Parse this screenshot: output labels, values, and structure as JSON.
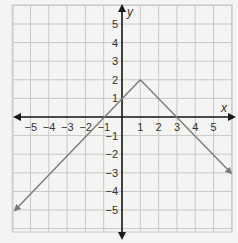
{
  "chart_data": {
    "type": "line",
    "title": "",
    "xlabel": "x",
    "ylabel": "y",
    "xlim": [
      -6,
      6
    ],
    "ylim": [
      -6,
      6
    ],
    "grid": true,
    "x_ticks": [
      -5,
      -4,
      -3,
      -2,
      -1,
      1,
      2,
      3,
      4,
      5
    ],
    "y_ticks": [
      -5,
      -4,
      -3,
      -2,
      -1,
      1,
      2,
      3,
      4,
      5
    ],
    "x_tick_labels": [
      "−5",
      "−4",
      "−3",
      "−2",
      "−1",
      "1",
      "2",
      "3",
      "4",
      "5"
    ],
    "y_tick_labels": [
      "−5",
      "−4",
      "−3",
      "−2",
      "−1",
      "1",
      "2",
      "3",
      "4",
      "5"
    ],
    "series": [
      {
        "name": "y = 2 − |x − 1|",
        "points": [
          [
            -6,
            -5
          ],
          [
            1,
            2
          ],
          [
            6,
            -3
          ]
        ],
        "vertex": [
          1,
          2
        ],
        "arrows_at_ends": true,
        "color": "#7a7a7a"
      }
    ]
  },
  "colors": {
    "background": "#f4f4f2",
    "grid": "#c8c8c8",
    "axis": "#1a1a1a",
    "line": "#7a7a7a"
  }
}
